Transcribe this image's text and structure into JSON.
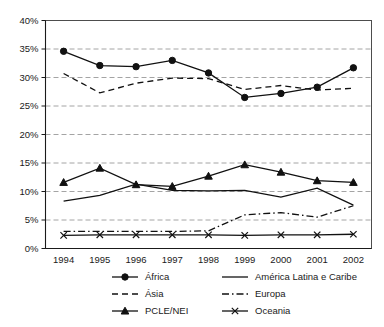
{
  "chart_data": {
    "type": "line",
    "title": "",
    "xlabel": "",
    "ylabel": "",
    "categories": [
      "1994",
      "1995",
      "1996",
      "1997",
      "1998",
      "1999",
      "2000",
      "2001",
      "2002"
    ],
    "x": [
      1994,
      1995,
      1996,
      1997,
      1998,
      1999,
      2000,
      2001,
      2002
    ],
    "ylim": [
      0,
      40
    ],
    "ytick_labels": [
      "0%",
      "5%",
      "10%",
      "15%",
      "20%",
      "25%",
      "30%",
      "35%",
      "40%"
    ],
    "ytick_values": [
      0,
      5,
      10,
      15,
      20,
      25,
      30,
      35,
      40
    ],
    "grid": true,
    "grid_axis": "y",
    "legend_position": "bottom",
    "value_unit": "%",
    "series": [
      {
        "name": "África",
        "marker": "circle",
        "line_style": "solid",
        "values": [
          34.6,
          32.1,
          31.9,
          33.0,
          30.8,
          26.5,
          27.2,
          28.3,
          31.7
        ]
      },
      {
        "name": "Ásia",
        "marker": "none",
        "line_style": "dashed",
        "values": [
          30.7,
          27.3,
          29.0,
          29.9,
          29.8,
          27.9,
          28.6,
          27.8,
          28.1
        ]
      },
      {
        "name": "PCLE/NEI",
        "marker": "triangle",
        "line_style": "solid",
        "values": [
          11.6,
          14.1,
          11.2,
          10.9,
          12.7,
          14.7,
          13.4,
          11.9,
          11.6
        ]
      },
      {
        "name": "América Latina e Caribe",
        "marker": "none",
        "line_style": "solid",
        "values": [
          8.3,
          9.3,
          11.3,
          10.2,
          10.1,
          10.2,
          9.0,
          10.6,
          7.6
        ]
      },
      {
        "name": "Europa",
        "marker": "none",
        "line_style": "dashdot",
        "values": [
          3.0,
          3.0,
          3.0,
          3.0,
          3.1,
          5.9,
          6.3,
          5.5,
          7.5
        ]
      },
      {
        "name": "Oceania",
        "marker": "x",
        "line_style": "solid",
        "values": [
          2.3,
          2.4,
          2.4,
          2.4,
          2.4,
          2.3,
          2.4,
          2.4,
          2.5
        ]
      }
    ]
  },
  "legend": {
    "entries": [
      {
        "label": "África",
        "marker": "circle",
        "line_style": "solid"
      },
      {
        "label": "América Latina e Caribe",
        "marker": "none",
        "line_style": "solid"
      },
      {
        "label": "Ásia",
        "marker": "none",
        "line_style": "dashed"
      },
      {
        "label": "Europa",
        "marker": "none",
        "line_style": "dashdot"
      },
      {
        "label": "PCLE/NEI",
        "marker": "triangle",
        "line_style": "solid"
      },
      {
        "label": "Oceania",
        "marker": "x",
        "line_style": "solid"
      }
    ]
  },
  "colors": {
    "line": "#111111",
    "grid": "#9a9a9a",
    "frame": "#4d4d4d",
    "text": "#1a1a1a",
    "background": "#ffffff"
  }
}
